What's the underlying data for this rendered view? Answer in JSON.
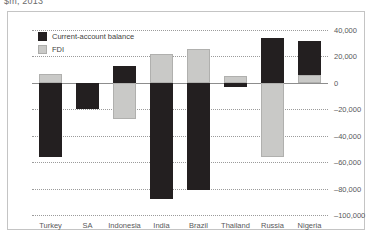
{
  "figure": {
    "caption": "$m, 2013"
  },
  "legend": {
    "position": "top-left",
    "items": [
      {
        "label": "Current-account balance",
        "color": "#231f20",
        "key": "cab"
      },
      {
        "label": "FDI",
        "color": "#c9c9c7",
        "key": "fdi"
      }
    ]
  },
  "axis": {
    "y_ticks": [
      "40,000",
      "20,000",
      "0",
      "–20,000",
      "–40,000",
      "–60,000",
      "–80,000",
      "–100,000"
    ]
  },
  "chart_data": {
    "type": "bar",
    "title": "$m, 2013",
    "xlabel": "",
    "ylabel": "",
    "ylim": [
      -100000,
      40000
    ],
    "grid": true,
    "legend_position": "top-left",
    "stacked": true,
    "categories": [
      "Turkey",
      "SA",
      "Indonesia",
      "India",
      "Brazil",
      "Thailand",
      "Russia",
      "Nigeria"
    ],
    "series": [
      {
        "name": "Current-account balance",
        "color": "#231f20",
        "values": [
          -56000,
          -20000,
          13000,
          -88000,
          -81000,
          -3000,
          34000,
          26000
        ]
      },
      {
        "name": "FDI",
        "color": "#c9c9c7",
        "values": [
          7000,
          0,
          -27000,
          22000,
          26000,
          5000,
          -56000,
          6000
        ]
      }
    ],
    "tick_values": [
      40000,
      20000,
      0,
      -20000,
      -40000,
      -60000,
      -80000,
      -100000
    ],
    "tick_labels": [
      "40,000",
      "20,000",
      "0",
      "–20,000",
      "–40,000",
      "–60,000",
      "–80,000",
      "–100,000"
    ]
  }
}
